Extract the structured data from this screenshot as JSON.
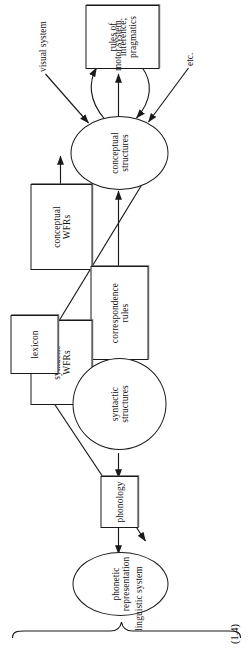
{
  "figure": {
    "number": "(1.4)",
    "caption_bracket_label": "linguistic system",
    "ink_color": "#1a1a1a",
    "background": "#ffffff"
  },
  "external_labels": [
    {
      "id": "visual-system",
      "text": "visual system"
    },
    {
      "id": "motor-system",
      "text": "motor system"
    },
    {
      "id": "etc",
      "text": "etc."
    }
  ],
  "nodes": [
    {
      "id": "conceptual-wfrs",
      "shape": "box",
      "lines": [
        "conceptual",
        "WFRs"
      ]
    },
    {
      "id": "conceptual-structures",
      "shape": "ellipse",
      "lines": [
        "conceptual",
        "structures"
      ]
    },
    {
      "id": "rules-of-inference",
      "shape": "box",
      "lines": [
        "rules of inference;",
        "pragmatics"
      ]
    },
    {
      "id": "correspondence-rules",
      "shape": "box",
      "lines": [
        "correspondence",
        "rules"
      ]
    },
    {
      "id": "syntactic-wfrs",
      "shape": "box",
      "lines": [
        "syntactic",
        "WFRs"
      ]
    },
    {
      "id": "syntactic-structures",
      "shape": "ellipse",
      "lines": [
        "syntactic",
        "structures"
      ]
    },
    {
      "id": "lexicon",
      "shape": "box",
      "lines": [
        "lexicon"
      ]
    },
    {
      "id": "phonology",
      "shape": "box",
      "lines": [
        "phonology"
      ]
    },
    {
      "id": "phonetic-representation",
      "shape": "ellipse",
      "lines": [
        "phonetic",
        "representation"
      ]
    }
  ],
  "edges": [
    {
      "id": "visual-to-conceptual",
      "from": "visual system",
      "to": "conceptual-structures",
      "arrow": "single"
    },
    {
      "id": "conceptual-to-motor",
      "from": "conceptual-structures",
      "to": "motor system",
      "arrow": "single"
    },
    {
      "id": "etc-to-conceptual",
      "from": "etc.",
      "to": "conceptual-structures",
      "arrow": "single"
    },
    {
      "id": "conceptual-wfrs-to-conceptual",
      "from": "conceptual-wfrs",
      "to": "conceptual-structures",
      "arrow": "single"
    },
    {
      "id": "conceptual-rules-inference",
      "from": "conceptual-structures",
      "to": "rules-of-inference",
      "arrow": "double-curved"
    },
    {
      "id": "correspondence-to-conceptual",
      "from": "correspondence-rules",
      "to": "conceptual-structures",
      "arrow": "single"
    },
    {
      "id": "correspondence-to-syntactic",
      "from": "correspondence-rules",
      "to": "syntactic-structures",
      "arrow": "single"
    },
    {
      "id": "syntactic-wfrs-to-syntactic",
      "from": "syntactic-wfrs",
      "to": "syntactic-structures",
      "arrow": "single"
    },
    {
      "id": "lexicon-to-syntactic",
      "from": "lexicon",
      "to": "syntactic-structures",
      "arrow": "single"
    },
    {
      "id": "lexicon-to-conceptual",
      "from": "lexicon",
      "to": "conceptual-structures",
      "arrow": "single"
    },
    {
      "id": "lexicon-to-phonetic",
      "from": "lexicon",
      "to": "phonetic-representation",
      "arrow": "single"
    },
    {
      "id": "syntactic-to-phonology",
      "from": "syntactic-structures",
      "to": "phonology",
      "arrow": "single"
    },
    {
      "id": "phonology-to-phonetic",
      "from": "phonology",
      "to": "phonetic-representation",
      "arrow": "single"
    }
  ]
}
